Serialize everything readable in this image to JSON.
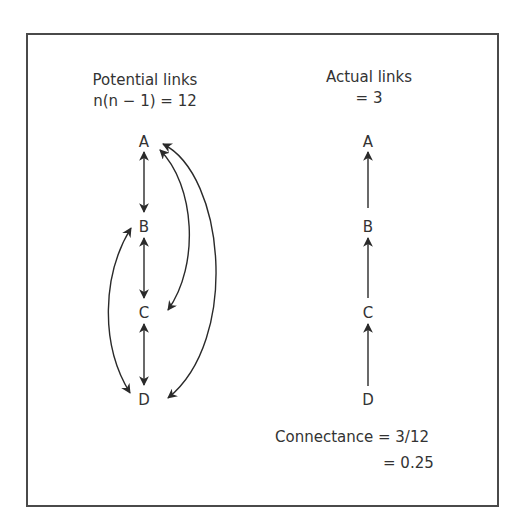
{
  "left_panel": {
    "title": "Potential links",
    "formula": "n(n − 1) = 12",
    "nodes": [
      "A",
      "B",
      "C",
      "D"
    ],
    "links": [
      {
        "from": "A",
        "to": "B",
        "type": "bidirectional"
      },
      {
        "from": "B",
        "to": "C",
        "type": "bidirectional"
      },
      {
        "from": "C",
        "to": "D",
        "type": "bidirectional"
      },
      {
        "from": "A",
        "to": "C",
        "type": "bidirectional-curve"
      },
      {
        "from": "A",
        "to": "D",
        "type": "bidirectional-curve"
      },
      {
        "from": "B",
        "to": "D",
        "type": "bidirectional-curve"
      }
    ]
  },
  "right_panel": {
    "title": "Actual links",
    "value": "= 3",
    "nodes": [
      "A",
      "B",
      "C",
      "D"
    ],
    "links": [
      {
        "from": "B",
        "to": "A"
      },
      {
        "from": "C",
        "to": "B"
      },
      {
        "from": "D",
        "to": "C"
      }
    ]
  },
  "connectance": {
    "line1": "Connectance = 3/12",
    "line2": "= 0.25"
  },
  "colors": {
    "stroke": "#2a2a2a",
    "frame": "#4a4a4a"
  }
}
